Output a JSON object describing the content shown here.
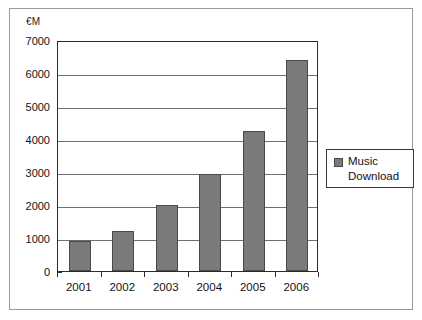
{
  "chart_data": {
    "type": "bar",
    "title": "",
    "xlabel": "",
    "ylabel": "€M",
    "categories": [
      "2001",
      "2002",
      "2003",
      "2004",
      "2005",
      "2006"
    ],
    "values": [
      900,
      1200,
      2000,
      2930,
      4250,
      6400
    ],
    "series": [
      {
        "name": "Music Download",
        "values": [
          900,
          1200,
          2000,
          2930,
          4250,
          6400
        ]
      }
    ],
    "ylim": [
      0,
      7000
    ],
    "ytick_labels": [
      "0",
      "1000",
      "2000",
      "3000",
      "4000",
      "5000",
      "6000",
      "7000"
    ],
    "ytick_values": [
      0,
      1000,
      2000,
      3000,
      4000,
      5000,
      6000,
      7000
    ],
    "grid": true,
    "legend_position": "right",
    "bar_color": "#7a7a7a",
    "bar_edge_color": "#4a4a4a",
    "axis_color": "#2b2b2b",
    "gridline_color": "#6f6f6f"
  },
  "axis": {
    "unit_label": "€M"
  },
  "legend": {
    "entries": [
      {
        "label_line1": "Music",
        "label_line2": "Download",
        "color": "#7a7a7a"
      }
    ]
  }
}
